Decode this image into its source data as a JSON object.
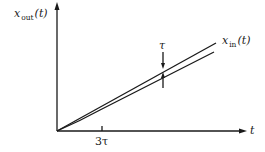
{
  "diagram": {
    "y_axis_label": {
      "var": "x",
      "sub": "out",
      "arg": "(t)"
    },
    "x_axis_label": "t",
    "input_label": {
      "var": "x",
      "sub": "in",
      "arg": "(t)"
    },
    "delay_label": "τ",
    "tick_label": "3τ",
    "colors": {
      "stroke": "#1a1a1a",
      "background": "#ffffff"
    }
  }
}
